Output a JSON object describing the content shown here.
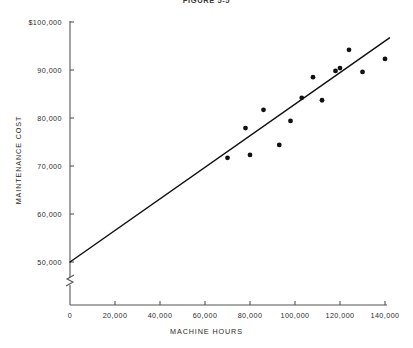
{
  "chart_data": {
    "type": "scatter",
    "title": "FIGURE 5-5",
    "xlabel": "MACHINE HOURS",
    "ylabel": "MAINTENANCE COST",
    "xlim": [
      0,
      142000
    ],
    "ylim": [
      48000,
      101000
    ],
    "grid": false,
    "legend": null,
    "y_axis_break": true,
    "x_ticks": [
      0,
      20000,
      40000,
      60000,
      80000,
      100000,
      120000,
      140000
    ],
    "x_tick_labels": [
      "0",
      "20,000",
      "40,000",
      "60,000",
      "80,000",
      "100,000",
      "120,000",
      "140,000"
    ],
    "y_ticks": [
      50000,
      60000,
      70000,
      80000,
      90000,
      100000
    ],
    "y_tick_labels": [
      "50,000",
      "60,000",
      "70,000",
      "80,000",
      "90,000",
      "$100,000"
    ],
    "points": [
      {
        "x": 70000,
        "y": 71700
      },
      {
        "x": 78000,
        "y": 77900
      },
      {
        "x": 80000,
        "y": 72300
      },
      {
        "x": 86000,
        "y": 81700
      },
      {
        "x": 93000,
        "y": 74400
      },
      {
        "x": 98000,
        "y": 79400
      },
      {
        "x": 103000,
        "y": 84200
      },
      {
        "x": 108000,
        "y": 88500
      },
      {
        "x": 112000,
        "y": 83700
      },
      {
        "x": 118000,
        "y": 89800
      },
      {
        "x": 120000,
        "y": 90400
      },
      {
        "x": 124000,
        "y": 94200
      },
      {
        "x": 130000,
        "y": 89600
      },
      {
        "x": 140000,
        "y": 92300
      }
    ],
    "trend_line": {
      "label": "regression line",
      "x_start": 0,
      "y_start": 50000,
      "x_end": 142000,
      "y_end": 96700
    },
    "colors": {
      "marker": "#111111",
      "line": "#111111",
      "axis": "#555555",
      "text": "#2b2b2b"
    }
  }
}
